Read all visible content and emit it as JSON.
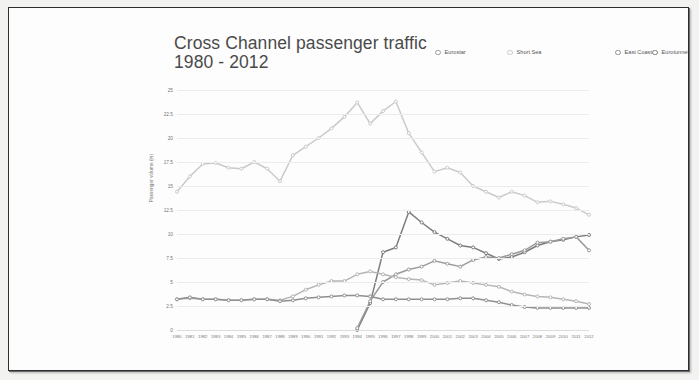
{
  "document": {
    "title_line1": "Cross Channel passenger traffic",
    "title_line2": "1980 - 2012"
  },
  "legend": {
    "items": [
      {
        "label": "Eurostar",
        "color": "#999a9c"
      },
      {
        "label": "Short Sea",
        "color": "#c9cacb"
      },
      {
        "label": "East Coast",
        "color": "#8e8f91"
      },
      {
        "label": "Eurotunnel shuttle",
        "color": "#7c7d7f"
      },
      {
        "label": "Western Channel",
        "color": "#b4b5b7"
      }
    ]
  },
  "chart_data": {
    "type": "line",
    "title": "Cross Channel passenger traffic 1980 - 2012",
    "xlabel": "",
    "ylabel": "Passenger volume (m)",
    "ylim": [
      0,
      25
    ],
    "yticks": [
      0,
      2.5,
      5,
      7.5,
      10,
      12.5,
      15,
      17.5,
      20,
      22.5,
      25
    ],
    "ytick_labels": [
      "0",
      "2.5",
      "5",
      "7.5",
      "10",
      "12.5",
      "15",
      "17.5",
      "20",
      "22.5",
      "25"
    ],
    "grid": true,
    "legend_position": "top-right",
    "markers": "open-circle",
    "x": [
      1980,
      1981,
      1982,
      1983,
      1984,
      1985,
      1986,
      1987,
      1988,
      1989,
      1990,
      1991,
      1992,
      1993,
      1994,
      1995,
      1996,
      1997,
      1998,
      1999,
      2000,
      2001,
      2002,
      2003,
      2004,
      2005,
      2006,
      2007,
      2008,
      2009,
      2010,
      2011,
      2012
    ],
    "xtick_labels": [
      "1980",
      "1981",
      "1982",
      "1983",
      "1984",
      "1985",
      "1986",
      "1987",
      "1988",
      "1989",
      "1990",
      "1991",
      "1992",
      "1993",
      "1994",
      "1995",
      "1996",
      "1997",
      "1998",
      "1999",
      "2000",
      "2001",
      "2002",
      "2003",
      "2004",
      "2005",
      "2006",
      "2007",
      "2008",
      "2009",
      "2010",
      "2011",
      "2012"
    ],
    "series": [
      {
        "name": "Short Sea",
        "color": "#c9cacb",
        "values": [
          14.4,
          16.0,
          17.3,
          17.4,
          16.9,
          16.8,
          17.5,
          16.8,
          15.5,
          18.2,
          19.1,
          20.0,
          21.0,
          22.2,
          23.7,
          21.5,
          22.8,
          23.8,
          20.5,
          18.5,
          16.5,
          16.9,
          16.4,
          15.0,
          14.4,
          13.8,
          14.4,
          14.0,
          13.3,
          13.4,
          13.1,
          12.7,
          12.0
        ]
      },
      {
        "name": "Eurotunnel shuttle",
        "color": "#7c7d7f",
        "values": [
          null,
          null,
          null,
          null,
          null,
          null,
          null,
          null,
          null,
          null,
          null,
          null,
          null,
          null,
          0.0,
          2.8,
          8.1,
          8.6,
          12.3,
          11.2,
          10.2,
          9.5,
          8.8,
          8.6,
          8.0,
          7.4,
          7.6,
          8.1,
          8.8,
          9.2,
          9.4,
          9.7,
          9.9
        ]
      },
      {
        "name": "Eurostar",
        "color": "#999a9c",
        "values": [
          null,
          null,
          null,
          null,
          null,
          null,
          null,
          null,
          null,
          null,
          null,
          null,
          null,
          null,
          0.2,
          3.0,
          5.0,
          5.8,
          6.3,
          6.6,
          7.2,
          6.9,
          6.6,
          7.3,
          7.6,
          7.5,
          7.9,
          8.3,
          9.1,
          9.2,
          9.5,
          9.7,
          8.3
        ]
      },
      {
        "name": "Western Channel",
        "color": "#b4b5b7",
        "values": [
          3.2,
          3.3,
          3.2,
          3.2,
          3.1,
          3.1,
          3.2,
          3.2,
          3.1,
          3.5,
          4.2,
          4.7,
          5.1,
          5.1,
          5.8,
          6.1,
          5.8,
          5.5,
          5.3,
          5.2,
          4.7,
          4.9,
          5.1,
          4.9,
          4.7,
          4.5,
          4.0,
          3.7,
          3.5,
          3.4,
          3.2,
          3.0,
          2.7
        ]
      },
      {
        "name": "East Coast",
        "color": "#8e8f91",
        "values": [
          3.2,
          3.4,
          3.2,
          3.2,
          3.1,
          3.1,
          3.2,
          3.2,
          3.0,
          3.1,
          3.3,
          3.4,
          3.5,
          3.6,
          3.6,
          3.5,
          3.2,
          3.2,
          3.2,
          3.2,
          3.2,
          3.2,
          3.3,
          3.3,
          3.1,
          2.9,
          2.6,
          2.4,
          2.3,
          2.3,
          2.3,
          2.3,
          2.3
        ]
      }
    ]
  }
}
